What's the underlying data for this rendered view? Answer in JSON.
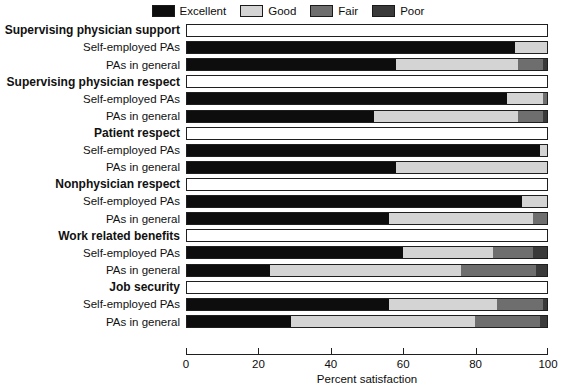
{
  "legend": {
    "items": [
      {
        "label": "Excellent",
        "color": "#0d0d0d"
      },
      {
        "label": "Good",
        "color": "#d4d4d4"
      },
      {
        "label": "Fair",
        "color": "#6e6e6e"
      },
      {
        "label": "Poor",
        "color": "#3a3a3a"
      }
    ]
  },
  "axis": {
    "label": "Percent satisfaction",
    "ticks": [
      "0",
      "20",
      "40",
      "60",
      "80",
      "100"
    ]
  },
  "chart_data": {
    "type": "bar",
    "orientation": "horizontal",
    "stacked": true,
    "title": "",
    "xlabel": "Percent satisfaction",
    "ylabel": "",
    "xlim": [
      0,
      100
    ],
    "grid": false,
    "legend_position": "top-center",
    "series": [
      {
        "name": "Excellent",
        "color": "#0d0d0d"
      },
      {
        "name": "Good",
        "color": "#d4d4d4"
      },
      {
        "name": "Fair",
        "color": "#6e6e6e"
      },
      {
        "name": "Poor",
        "color": "#3a3a3a"
      }
    ],
    "groups": [
      {
        "label": "Supervising physician support",
        "rows": [
          {
            "label": "Self-employed PAs",
            "values": [
              91,
              9,
              0,
              0
            ]
          },
          {
            "label": "PAs in general",
            "values": [
              58,
              34,
              7,
              1
            ]
          }
        ]
      },
      {
        "label": "Supervising physician respect",
        "rows": [
          {
            "label": "Self-employed PAs",
            "values": [
              89,
              10,
              1,
              0
            ]
          },
          {
            "label": "PAs in general",
            "values": [
              52,
              40,
              7,
              1
            ]
          }
        ]
      },
      {
        "label": "Patient respect",
        "rows": [
          {
            "label": "Self-employed PAs",
            "values": [
              98,
              2,
              0,
              0
            ]
          },
          {
            "label": "PAs in general",
            "values": [
              58,
              42,
              0,
              0
            ]
          }
        ]
      },
      {
        "label": "Nonphysician respect",
        "rows": [
          {
            "label": "Self-employed PAs",
            "values": [
              93,
              7,
              0,
              0
            ]
          },
          {
            "label": "PAs in general",
            "values": [
              56,
              40,
              4,
              0
            ]
          }
        ]
      },
      {
        "label": "Work related benefits",
        "rows": [
          {
            "label": "Self-employed PAs",
            "values": [
              60,
              25,
              11,
              4
            ]
          },
          {
            "label": "PAs in general",
            "values": [
              23,
              53,
              21,
              3
            ]
          }
        ]
      },
      {
        "label": "Job security",
        "rows": [
          {
            "label": "Self-employed PAs",
            "values": [
              56,
              30,
              13,
              1
            ]
          },
          {
            "label": "PAs in general",
            "values": [
              29,
              51,
              18,
              2
            ]
          }
        ]
      }
    ]
  }
}
